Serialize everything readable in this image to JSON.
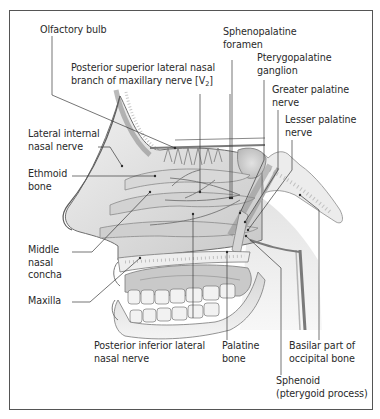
{
  "figure": {
    "type": "anatomical-illustration",
    "colors": {
      "frame": "#555555",
      "text": "#2a2a2a",
      "leader_line": "#3a3a3a",
      "bone_fill": "#e9e9e9",
      "soft_tissue": "#cfcfcf",
      "shadow": "#9a9a9a"
    }
  },
  "labels": {
    "olfactory_bulb": "Olfactory bulb",
    "post_sup_lat_nasal_l1": "Posterior superior lateral nasal",
    "post_sup_lat_nasal_l2": "branch of maxillary nerve [V",
    "post_sup_lat_nasal_sub": "2",
    "post_sup_lat_nasal_end": "]",
    "sphenopalatine_l1": "Sphenopalatine",
    "sphenopalatine_l2": "foramen",
    "pterygopalatine_l1": "Pterygopalatine",
    "pterygopalatine_l2": "ganglion",
    "greater_palatine_l1": "Greater palatine",
    "greater_palatine_l2": "nerve",
    "lesser_palatine_l1": "Lesser palatine",
    "lesser_palatine_l2": "nerve",
    "lateral_internal_l1": "Lateral internal",
    "lateral_internal_l2": "nasal nerve",
    "ethmoid_l1": "Ethmoid",
    "ethmoid_l2": "bone",
    "middle_concha_l1": "Middle",
    "middle_concha_l2": "nasal",
    "middle_concha_l3": "concha",
    "maxilla": "Maxilla",
    "post_inf_lat_l1": "Posterior inferior lateral",
    "post_inf_lat_l2": "nasal nerve",
    "palatine_l1": "Palatine",
    "palatine_l2": "bone",
    "basilar_l1": "Basilar part of",
    "basilar_l2": "occipital bone",
    "sphenoid_l1": "Sphenoid",
    "sphenoid_l2": "(pterygoid process)"
  }
}
